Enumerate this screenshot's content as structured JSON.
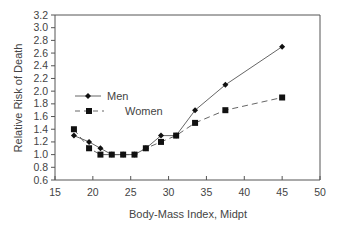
{
  "chart_data": {
    "type": "line",
    "title": "",
    "xlabel": "Body-Mass Index, Midpt",
    "ylabel": "Relative Risk of Death",
    "xlim": [
      15,
      50
    ],
    "ylim": [
      0.6,
      3.2
    ],
    "x_ticks": [
      15,
      20,
      25,
      30,
      35,
      40,
      45,
      50
    ],
    "y_ticks": [
      0.6,
      0.8,
      1.0,
      1.2,
      1.4,
      1.6,
      1.8,
      2.0,
      2.2,
      2.4,
      2.6,
      2.8,
      3.0,
      3.2
    ],
    "grid": false,
    "legend_position": "upper-left inside",
    "series": [
      {
        "name": "Men",
        "marker": "diamond",
        "line": "solid",
        "x": [
          17.5,
          19.5,
          21,
          22.5,
          24,
          25.5,
          27,
          29,
          31,
          33.5,
          37.5,
          45
        ],
        "values": [
          1.3,
          1.2,
          1.1,
          1.0,
          1.0,
          1.0,
          1.1,
          1.3,
          1.3,
          1.7,
          2.1,
          2.7
        ]
      },
      {
        "name": "Women",
        "marker": "square",
        "line": "dashed",
        "x": [
          17.5,
          19.5,
          21,
          22.5,
          24,
          25.5,
          27,
          29,
          31,
          33.5,
          37.5,
          45
        ],
        "values": [
          1.4,
          1.1,
          1.0,
          1.0,
          1.0,
          1.0,
          1.1,
          1.2,
          1.3,
          1.5,
          1.7,
          1.9
        ]
      }
    ]
  },
  "legend": {
    "men_label": "Men",
    "women_label": "Women"
  },
  "colors": {
    "line": "#666666",
    "marker": "#111111",
    "axis": "#555555",
    "text": "#444444"
  }
}
